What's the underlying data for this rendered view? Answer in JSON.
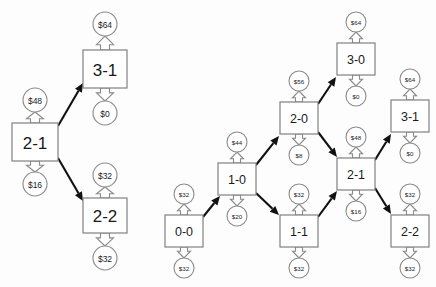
{
  "diagram": {
    "colors": {
      "background": "#fdfdfd",
      "box_stroke": "#808080",
      "circle_stroke": "#8a8a8a",
      "edge": "#111111",
      "text": "#1a1a1a"
    },
    "clusters": [
      {
        "id": "left-cluster",
        "name": "left-subtree",
        "nodes": [
          {
            "id": "L-2-1",
            "label": "2-1",
            "x": 12,
            "y": 123,
            "w": 46,
            "h": 38,
            "size": "big",
            "cost_up": "$48",
            "cost_down": "$16",
            "cost_up_cx": 35,
            "cost_up_cy": 100,
            "cost_r": 12,
            "cost_down_cx": 35,
            "cost_down_cy": 184
          },
          {
            "id": "L-3-1",
            "label": "3-1",
            "x": 83,
            "y": 50,
            "w": 44,
            "h": 38,
            "size": "big",
            "cost_up": "$64",
            "cost_down": "$0",
            "cost_up_cx": 105,
            "cost_up_cy": 24,
            "cost_r": 12,
            "cost_down_cx": 105,
            "cost_down_cy": 113
          },
          {
            "id": "L-2-2",
            "label": "2-2",
            "x": 83,
            "y": 198,
            "w": 44,
            "h": 35,
            "size": "big",
            "cost_up": "$32",
            "cost_down": "$32",
            "cost_up_cx": 105,
            "cost_up_cy": 175,
            "cost_r": 12,
            "cost_down_cx": 105,
            "cost_down_cy": 258
          }
        ],
        "edges": [
          {
            "id": "L-e1",
            "from": "L-2-1",
            "to": "L-3-1",
            "x1": 58,
            "y1": 126,
            "x2": 83,
            "y2": 83
          },
          {
            "id": "L-e2",
            "from": "L-2-1",
            "to": "L-2-2",
            "x1": 58,
            "y1": 158,
            "x2": 83,
            "y2": 201
          }
        ]
      },
      {
        "id": "right-cluster",
        "name": "full-lattice",
        "nodes": [
          {
            "id": "R-0-0",
            "label": "0-0",
            "x": 165,
            "y": 215,
            "w": 38,
            "h": 32,
            "size": "small",
            "cost_up": "$32",
            "cost_down": "$32",
            "cost_up_cx": 184,
            "cost_up_cy": 194,
            "cost_r": 10,
            "cost_down_cx": 184,
            "cost_down_cy": 268
          },
          {
            "id": "R-1-0",
            "label": "1-0",
            "x": 218,
            "y": 163,
            "w": 38,
            "h": 32,
            "size": "small",
            "cost_up": "$44",
            "cost_down": "$20",
            "cost_up_cx": 237,
            "cost_up_cy": 142,
            "cost_r": 10,
            "cost_down_cx": 237,
            "cost_down_cy": 216
          },
          {
            "id": "R-1-1",
            "label": "1-1",
            "x": 280,
            "y": 215,
            "w": 38,
            "h": 32,
            "size": "small",
            "cost_up": "$32",
            "cost_down": "$32",
            "cost_up_cx": 299,
            "cost_up_cy": 194,
            "cost_r": 10,
            "cost_down_cx": 299,
            "cost_down_cy": 268
          },
          {
            "id": "R-2-0",
            "label": "2-0",
            "x": 280,
            "y": 102,
            "w": 38,
            "h": 32,
            "size": "small",
            "cost_up": "$56",
            "cost_down": "$8",
            "cost_up_cx": 299,
            "cost_up_cy": 81,
            "cost_r": 10,
            "cost_down_cx": 299,
            "cost_down_cy": 155
          },
          {
            "id": "R-2-1",
            "label": "2-1",
            "x": 337,
            "y": 158,
            "w": 38,
            "h": 32,
            "size": "small",
            "cost_up": "$48",
            "cost_down": "$16",
            "cost_up_cx": 356,
            "cost_up_cy": 137,
            "cost_r": 10,
            "cost_down_cx": 356,
            "cost_down_cy": 211
          },
          {
            "id": "R-2-2",
            "label": "2-2",
            "x": 391,
            "y": 215,
            "w": 38,
            "h": 32,
            "size": "small",
            "cost_up": "$32",
            "cost_down": "$32",
            "cost_up_cx": 410,
            "cost_up_cy": 194,
            "cost_r": 10,
            "cost_down_cx": 410,
            "cost_down_cy": 268
          },
          {
            "id": "R-3-0",
            "label": "3-0",
            "x": 337,
            "y": 43,
            "w": 38,
            "h": 32,
            "size": "small",
            "cost_up": "$64",
            "cost_down": "$0",
            "cost_up_cx": 356,
            "cost_up_cy": 22,
            "cost_r": 10,
            "cost_down_cx": 356,
            "cost_down_cy": 96
          },
          {
            "id": "R-3-1",
            "label": "3-1",
            "x": 391,
            "y": 100,
            "w": 38,
            "h": 32,
            "size": "small",
            "cost_up": "$64",
            "cost_down": "$0",
            "cost_up_cx": 410,
            "cost_up_cy": 79,
            "cost_r": 10,
            "cost_down_cx": 410,
            "cost_down_cy": 153
          }
        ],
        "edges": [
          {
            "id": "R-e1",
            "from": "R-0-0",
            "to": "R-1-0",
            "x1": 203,
            "y1": 217,
            "x2": 220,
            "y2": 196
          },
          {
            "id": "R-e2",
            "from": "R-1-0",
            "to": "R-2-0",
            "x1": 256,
            "y1": 165,
            "x2": 279,
            "y2": 136
          },
          {
            "id": "R-e3",
            "from": "R-1-0",
            "to": "R-1-1",
            "x1": 256,
            "y1": 193,
            "x2": 279,
            "y2": 215
          },
          {
            "id": "R-e4",
            "from": "R-2-0",
            "to": "R-3-0",
            "x1": 318,
            "y1": 104,
            "x2": 336,
            "y2": 77
          },
          {
            "id": "R-e5",
            "from": "R-2-0",
            "to": "R-2-1",
            "x1": 318,
            "y1": 132,
            "x2": 337,
            "y2": 157
          },
          {
            "id": "R-e6",
            "from": "R-1-1",
            "to": "R-2-1",
            "x1": 318,
            "y1": 217,
            "x2": 337,
            "y2": 191
          },
          {
            "id": "R-e7",
            "from": "R-2-1",
            "to": "R-3-1",
            "x1": 375,
            "y1": 160,
            "x2": 391,
            "y2": 134
          },
          {
            "id": "R-e8",
            "from": "R-2-1",
            "to": "R-2-2",
            "x1": 375,
            "y1": 188,
            "x2": 391,
            "y2": 214
          }
        ]
      }
    ]
  }
}
